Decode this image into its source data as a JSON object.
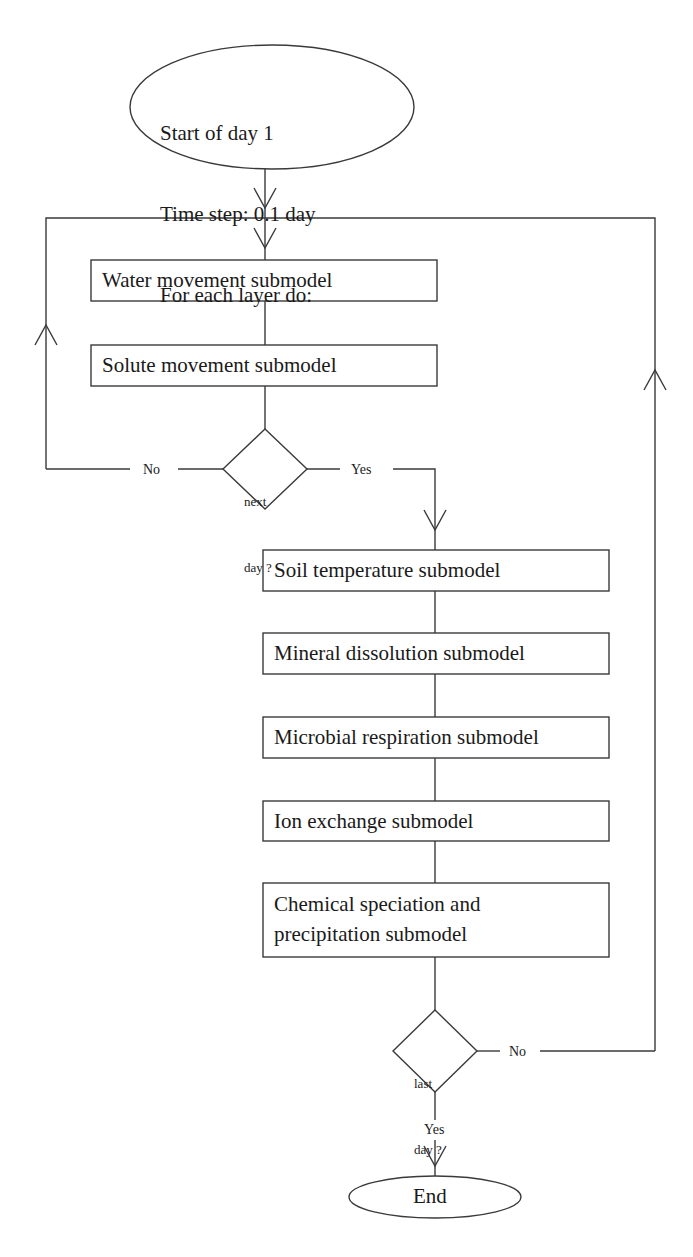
{
  "diagram": {
    "type": "flowchart",
    "start": {
      "shape": "ellipse",
      "lines": [
        "Start of day 1",
        "Time step: 0.1 day",
        "For each layer do:"
      ]
    },
    "inner_loop_boxes": [
      {
        "id": "water",
        "label": "Water movement submodel"
      },
      {
        "id": "solute",
        "label": "Solute movement submodel"
      }
    ],
    "decision_next_day": {
      "lines": [
        "next",
        "day ?"
      ],
      "no_label": "No",
      "yes_label": "Yes"
    },
    "daily_boxes": [
      {
        "id": "soil-temp",
        "label": "Soil temperature submodel"
      },
      {
        "id": "mineral",
        "label": "Mineral dissolution submodel"
      },
      {
        "id": "microbial",
        "label": "Microbial respiration submodel"
      },
      {
        "id": "ion",
        "label": "Ion exchange submodel"
      },
      {
        "id": "chemical",
        "label": "Chemical speciation and\nprecipitation submodel"
      }
    ],
    "decision_last_day": {
      "lines": [
        "last",
        "day ?"
      ],
      "no_label": "No",
      "yes_label": "Yes"
    },
    "end": {
      "shape": "ellipse",
      "label": "End"
    },
    "colors": {
      "line": "#3a3a3a",
      "text": "#1a1a1a",
      "background": "#ffffff"
    }
  }
}
